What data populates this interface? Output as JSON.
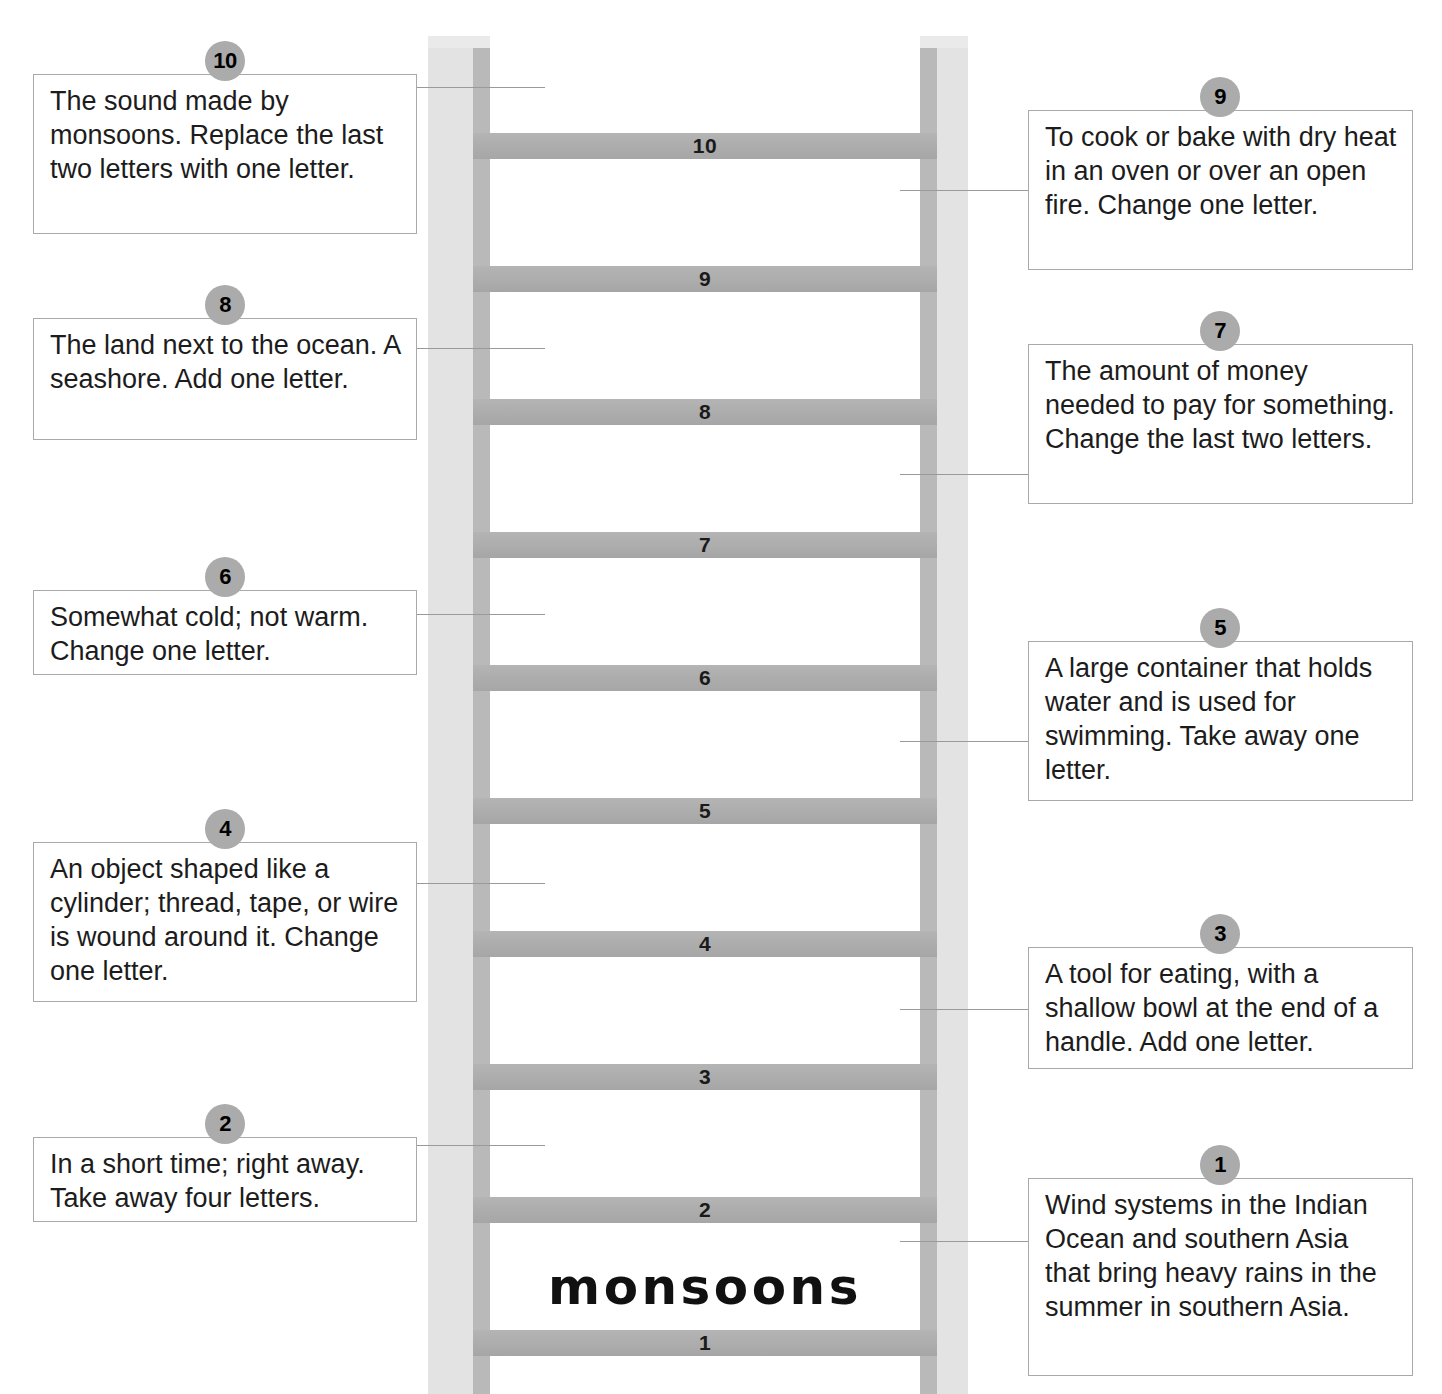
{
  "puzzle": {
    "type": "word-ladder",
    "start_word": "monsoons",
    "rung_count": 10,
    "colors": {
      "rail_light": "#e3e3e3",
      "rail_dark": "#b9b9b9",
      "rung": "#aeaeae",
      "badge": "#ababab",
      "box_border": "#a9a9a9",
      "connector": "#9a9a9a",
      "text": "#1c1c1c"
    }
  },
  "ladder": {
    "rungs": [
      {
        "number": "10"
      },
      {
        "number": "9"
      },
      {
        "number": "8"
      },
      {
        "number": "7"
      },
      {
        "number": "6"
      },
      {
        "number": "5"
      },
      {
        "number": "4"
      },
      {
        "number": "3"
      },
      {
        "number": "2"
      },
      {
        "number": "1"
      }
    ],
    "base_word": "monsoons"
  },
  "clues": [
    {
      "number": "10",
      "side": "left",
      "text": "The sound made by monsoons.  Replace the last two letters with one letter."
    },
    {
      "number": "9",
      "side": "right",
      "text": "To cook or bake with dry heat in an oven or over an open fire.  Change one letter."
    },
    {
      "number": "8",
      "side": "left",
      "text": "The land next to the ocean.  A seashore.  Add one letter."
    },
    {
      "number": "7",
      "side": "right",
      "text": "The amount of money needed to pay for something.  Change the last two letters."
    },
    {
      "number": "6",
      "side": "left",
      "text": "Somewhat cold; not warm. Change one letter."
    },
    {
      "number": "5",
      "side": "right",
      "text": "A large container that holds water and is used for swimming.  Take away one letter."
    },
    {
      "number": "4",
      "side": "left",
      "text": "An object shaped like a cylinder; thread, tape, or wire is wound around it. Change one letter."
    },
    {
      "number": "3",
      "side": "right",
      "text": "A tool for eating, with a shallow bowl at the end of a handle.  Add one letter."
    },
    {
      "number": "2",
      "side": "left",
      "text": "In a short time; right away. Take away four letters."
    },
    {
      "number": "1",
      "side": "right",
      "text": "Wind systems in the Indian Ocean and southern Asia that bring heavy rains in the summer in southern Asia."
    }
  ]
}
